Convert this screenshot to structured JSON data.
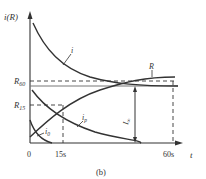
{
  "figure": {
    "caption": "(b)",
    "y_axis_label": "i(R)",
    "x_axis_label": "t",
    "origin_label": "0",
    "x_ticks": [
      {
        "label": "15s",
        "value": 15
      },
      {
        "label": "60s",
        "value": 60
      }
    ],
    "y_markers": [
      {
        "label": "R15",
        "main": "R",
        "sub": "15"
      },
      {
        "label": "R60",
        "main": "R",
        "sub": "60"
      }
    ],
    "curves": [
      {
        "name": "i",
        "label": "i",
        "description": "total current, decaying"
      },
      {
        "name": "R",
        "label": "R",
        "description": "insulation resistance, rising to R60"
      },
      {
        "name": "i_p",
        "label": "i",
        "sub": "p",
        "description": "absorption current, decaying"
      },
      {
        "name": "i_0",
        "label": "i",
        "sub": "0",
        "description": "capacitive charging current, fast decay"
      }
    ],
    "steady_current": {
      "label": "I",
      "sub": "∞"
    },
    "colors": {
      "line": "#333333",
      "background": "#ffffff"
    }
  }
}
